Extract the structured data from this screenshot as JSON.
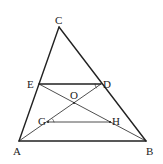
{
  "diagram": {
    "type": "geometry",
    "points": {
      "A": {
        "label": "A",
        "x": 19,
        "y": 141
      },
      "B": {
        "label": "B",
        "x": 146,
        "y": 141
      },
      "C": {
        "label": "C",
        "x": 59,
        "y": 27
      },
      "D": {
        "label": "D",
        "x": 101,
        "y": 84
      },
      "E": {
        "label": "E",
        "x": 39,
        "y": 84
      },
      "O": {
        "label": "O",
        "x": 74,
        "y": 103
      },
      "G": {
        "label": "G",
        "x": 48,
        "y": 122
      },
      "H": {
        "label": "H",
        "x": 110,
        "y": 122
      }
    },
    "segments": [
      [
        "A",
        "B"
      ],
      [
        "B",
        "C"
      ],
      [
        "C",
        "A"
      ],
      [
        "E",
        "D"
      ],
      [
        "E",
        "B"
      ],
      [
        "A",
        "D"
      ],
      [
        "G",
        "H"
      ]
    ],
    "colors": {
      "line": "#222222",
      "background": "#ffffff"
    }
  }
}
